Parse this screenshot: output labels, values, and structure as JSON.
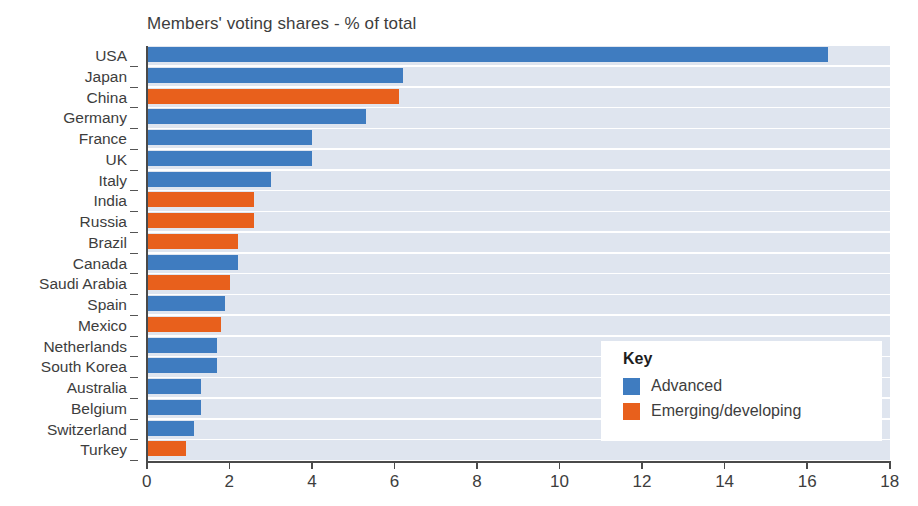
{
  "chart_data": {
    "type": "bar",
    "orientation": "horizontal",
    "title": "Members' voting shares - % of total",
    "xlabel": "",
    "ylabel": "",
    "xlim": [
      0,
      18
    ],
    "xticks": [
      0,
      2,
      4,
      6,
      8,
      10,
      12,
      14,
      16,
      18
    ],
    "grid": false,
    "categories": [
      "USA",
      "Japan",
      "China",
      "Germany",
      "France",
      "UK",
      "Italy",
      "India",
      "Russia",
      "Brazil",
      "Canada",
      "Saudi Arabia",
      "Spain",
      "Mexico",
      "Netherlands",
      "South Korea",
      "Australia",
      "Belgium",
      "Switzerland",
      "Turkey"
    ],
    "values": [
      16.5,
      6.2,
      6.1,
      5.3,
      4.0,
      4.0,
      3.0,
      2.6,
      2.6,
      2.2,
      2.2,
      2.0,
      1.9,
      1.8,
      1.7,
      1.7,
      1.3,
      1.3,
      1.15,
      0.95
    ],
    "groups": [
      "Advanced",
      "Advanced",
      "Emerging/developing",
      "Advanced",
      "Advanced",
      "Advanced",
      "Advanced",
      "Emerging/developing",
      "Emerging/developing",
      "Emerging/developing",
      "Advanced",
      "Emerging/developing",
      "Advanced",
      "Emerging/developing",
      "Advanced",
      "Advanced",
      "Advanced",
      "Advanced",
      "Advanced",
      "Emerging/developing"
    ],
    "legend": {
      "position": "inside-right-lower",
      "title": "Key",
      "entries": [
        {
          "label": "Advanced",
          "color": "#3f7cc0"
        },
        {
          "label": "Emerging/developing",
          "color": "#e8601c"
        }
      ]
    },
    "colors": {
      "advanced": "#3f7cc0",
      "emerging": "#e8601c",
      "track": "#dfe5ef",
      "background": "#ffffff",
      "axis": "#4a4a4a",
      "text": "#3d3d3d"
    }
  }
}
